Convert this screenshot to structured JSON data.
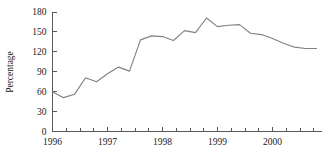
{
  "chart_data": {
    "type": "line",
    "title": "",
    "subtitle": "",
    "xlabel": "",
    "ylabel": "Percentage",
    "ylim": [
      0,
      180
    ],
    "yticks": [
      0,
      30,
      60,
      90,
      120,
      150,
      180
    ],
    "ytick_labels": [
      "0",
      "30",
      "60",
      "90",
      "120",
      "150",
      "180"
    ],
    "xlim": [
      1996.0,
      2000.9
    ],
    "xticks": [
      1996,
      1997,
      1998,
      1999,
      2000
    ],
    "xtick_labels": [
      "1996",
      "1997",
      "1998",
      "1999",
      "2000"
    ],
    "minor_xtick_interval": 0.25,
    "grid": false,
    "legend": null,
    "legend_position": "none",
    "line_color": "#7d8386",
    "axis_color": "#555b5e",
    "background_color": "#ffffff",
    "series": [
      {
        "name": "Percentage",
        "x": [
          1996.0,
          1996.2,
          1996.4,
          1996.6,
          1996.8,
          1997.0,
          1997.2,
          1997.4,
          1997.6,
          1997.8,
          1998.0,
          1998.2,
          1998.4,
          1998.6,
          1998.8,
          1999.0,
          1999.2,
          1999.4,
          1999.6,
          1999.8,
          2000.0,
          2000.2,
          2000.4,
          2000.6,
          2000.8
        ],
        "values": [
          60,
          51,
          56,
          81,
          75,
          87,
          97,
          91,
          138,
          144,
          143,
          137,
          152,
          149,
          171,
          158,
          160,
          161,
          148,
          146,
          140,
          133,
          127,
          125,
          125
        ]
      }
    ]
  }
}
